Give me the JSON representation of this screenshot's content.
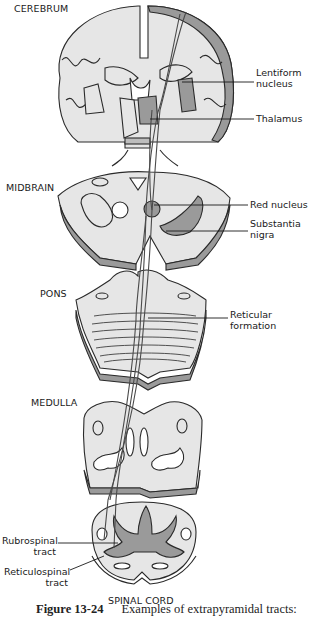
{
  "sections": {
    "cerebrum": "CEREBRUM",
    "midbrain": "MIDBRAIN",
    "pons": "PONS",
    "medulla": "MEDULLA",
    "spinal_cord": "SPINAL CORD"
  },
  "labels": {
    "lentiform_1": "Lentiform",
    "lentiform_2": "nucleus",
    "thalamus": "Thalamus",
    "red_nucleus": "Red nucleus",
    "substantia_1": "Substantia",
    "substantia_2": "nigra",
    "reticular_1": "Reticular",
    "reticular_2": "formation",
    "rubrospinal_1": "Rubrospinal",
    "rubrospinal_2": "tract",
    "reticulospinal_1": "Reticulospinal",
    "reticulospinal_2": "tract"
  },
  "caption": {
    "figure_number": "Figure 13-24",
    "text": "Examples of extrapyramidal tracts:"
  },
  "colors": {
    "outline": "#2a2a2a",
    "fill_light": "#e6e6e6",
    "fill_gray": "#9a9a9a",
    "fill_mid": "#bdbdbd"
  }
}
